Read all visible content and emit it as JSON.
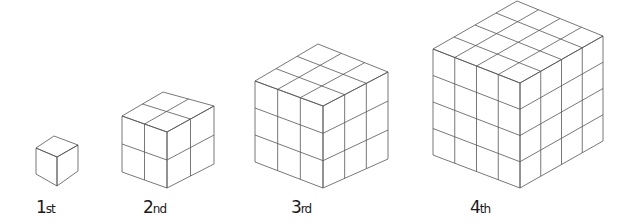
{
  "figure": {
    "line_color": "#555555",
    "background": "#ffffff",
    "cubes": [
      {
        "label_num": "1",
        "label_suffix": "st",
        "n": 1,
        "top": [
          54,
          136
        ],
        "lt": [
          36,
          148
        ],
        "ft": [
          57,
          157
        ],
        "rt": [
          78,
          145
        ],
        "lb": [
          36,
          174
        ],
        "fb": [
          57,
          186
        ],
        "rb": [
          78,
          171
        ],
        "label_x": 36
      },
      {
        "label_num": "2",
        "label_suffix": "nd",
        "n": 2,
        "top": [
          163,
          92
        ],
        "lt": [
          122,
          116
        ],
        "ft": [
          167,
          132
        ],
        "rt": [
          214,
          106
        ],
        "lb": [
          122,
          172
        ],
        "fb": [
          167,
          188
        ],
        "rb": [
          214,
          164
        ],
        "label_x": 143
      },
      {
        "label_num": "3",
        "label_suffix": "rd",
        "n": 3,
        "top": [
          318,
          44
        ],
        "lt": [
          255,
          81
        ],
        "ft": [
          323,
          106
        ],
        "rt": [
          388,
          72
        ],
        "lb": [
          255,
          162
        ],
        "fb": [
          323,
          188
        ],
        "rb": [
          388,
          159
        ],
        "label_x": 291
      },
      {
        "label_num": "4",
        "label_suffix": "th",
        "n": 4,
        "top": [
          517,
          1
        ],
        "lt": [
          433,
          49
        ],
        "ft": [
          520,
          83
        ],
        "rt": [
          603,
          36
        ],
        "lb": [
          433,
          155
        ],
        "fb": [
          520,
          188
        ],
        "rb": [
          603,
          141
        ],
        "label_x": 470
      }
    ]
  }
}
